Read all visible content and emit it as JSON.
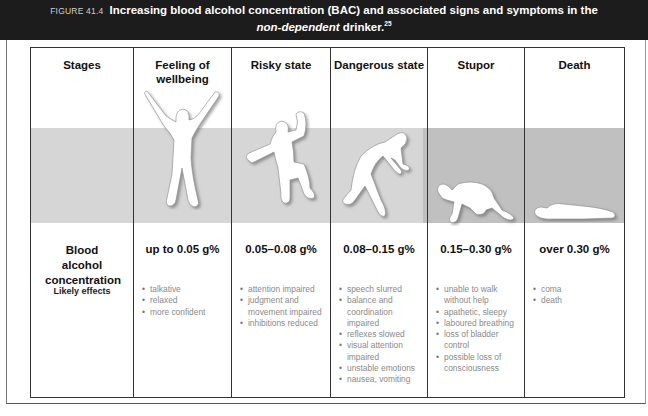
{
  "header": {
    "figure_label": "FIGURE 41.4",
    "title_line1": "Increasing blood alcohol concentration (BAC) and associated signs and symptoms in the",
    "title_line2_italic": "non-dependent",
    "title_line2_rest": " drinker.",
    "superscript": "25"
  },
  "row_labels": {
    "stages": "Stages",
    "bac": "Blood alcohol concentration",
    "effects": "Likely effects"
  },
  "colors": {
    "header_bg": "#1c1c1c",
    "band_light": "#d6d6d6",
    "band_dark": "#c0c0c0",
    "effects_text": "#8a8a8a"
  },
  "stages": [
    {
      "name": "Feeling of wellbeing",
      "bac": "up to 0.05 g%",
      "figure": "standing-arms-raised",
      "effects": [
        "talkative",
        "relaxed",
        "more confident"
      ]
    },
    {
      "name": "Risky state",
      "bac": "0.05–0.08 g%",
      "figure": "staggering-one-leg",
      "effects": [
        "attention impaired",
        "judgment and movement impaired",
        "inhibitions reduced"
      ]
    },
    {
      "name": "Dangerous state",
      "bac": "0.08–0.15 g%",
      "figure": "hunched-stumbling",
      "effects": [
        "speech slurred",
        "balance and coordination impaired",
        "reflexes slowed",
        "visual attention impaired",
        "unstable emotions",
        "nausea, vomiting"
      ]
    },
    {
      "name": "Stupor",
      "bac": "0.15–0.30 g%",
      "figure": "crawling",
      "effects": [
        "unable to walk without help",
        "apathetic, sleepy",
        "laboured breathing",
        "loss of bladder control",
        "possible loss of consciousness"
      ]
    },
    {
      "name": "Death",
      "bac": "over 0.30 g%",
      "figure": "lying-flat",
      "effects": [
        "coma",
        "death"
      ]
    }
  ]
}
